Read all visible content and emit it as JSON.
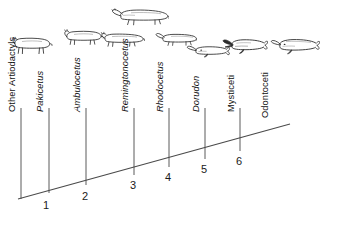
{
  "diagram": {
    "type": "cladogram",
    "line_color": "#4a4a4a",
    "text_color": "#111111"
  },
  "taxa": [
    {
      "id": "other-artiodactyls",
      "label": "Other Artiodactyls",
      "italic": false,
      "organism": "quadruped-mammal",
      "tip_x": 21,
      "label_x": 17,
      "label_y": 108,
      "branch_top_y": 108,
      "branch_bottom_y": 199
    },
    {
      "id": "pakicetus",
      "label": "Pakicetus",
      "italic": true,
      "organism": "quadruped-mammal",
      "tip_x": 49,
      "label_x": 45,
      "label_y": 108,
      "branch_top_y": 108,
      "branch_bottom_y": 193
    },
    {
      "id": "ambulocetus",
      "label": "Ambulocetus",
      "italic": true,
      "organism": "semiaquatic-mammal",
      "tip_x": 86,
      "label_x": 82,
      "label_y": 108,
      "branch_top_y": 108,
      "branch_bottom_y": 185
    },
    {
      "id": "remingtonocetus",
      "label": "Remingtonocetus",
      "italic": true,
      "organism": "long-snout-whale",
      "tip_x": 134,
      "label_x": 130,
      "label_y": 108,
      "branch_top_y": 108,
      "branch_bottom_y": 175
    },
    {
      "id": "rhodocetus",
      "label": "Rhodocetus",
      "italic": true,
      "organism": "early-whale",
      "tip_x": 169,
      "label_x": 165,
      "label_y": 108,
      "branch_top_y": 108,
      "branch_bottom_y": 167
    },
    {
      "id": "dorudon",
      "label": "Dorudon",
      "italic": true,
      "organism": "slender-whale",
      "tip_x": 205,
      "label_x": 201,
      "label_y": 108,
      "branch_top_y": 108,
      "branch_bottom_y": 159
    },
    {
      "id": "mysticeti",
      "label": "Mysticeti",
      "italic": false,
      "organism": "baleen-whale",
      "tip_x": 240,
      "label_x": 236,
      "label_y": 108,
      "branch_top_y": 108,
      "branch_bottom_y": 151
    },
    {
      "id": "odontoceti",
      "label": "Odontoceti",
      "italic": false,
      "organism": "toothed-whale",
      "tip_x": 290,
      "label_x": 270,
      "label_y": 108,
      "branch_top_y": 108,
      "branch_bottom_y": 124
    }
  ],
  "nodes": [
    {
      "id": "node-1",
      "label": "1",
      "x": 49,
      "y": 193,
      "text_x": 46,
      "text_y": 209
    },
    {
      "id": "node-2",
      "label": "2",
      "x": 86,
      "y": 185,
      "text_x": 85,
      "text_y": 200
    },
    {
      "id": "node-3",
      "label": "3",
      "x": 134,
      "y": 175,
      "text_x": 133,
      "text_y": 189
    },
    {
      "id": "node-4",
      "label": "4",
      "x": 169,
      "y": 167,
      "text_x": 168,
      "text_y": 181
    },
    {
      "id": "node-5",
      "label": "5",
      "x": 205,
      "y": 159,
      "text_x": 204,
      "text_y": 173
    },
    {
      "id": "node-6",
      "label": "6",
      "x": 240,
      "y": 151,
      "text_x": 239,
      "text_y": 165
    }
  ],
  "baseline": {
    "x1": 18,
    "y1": 199,
    "x2": 290,
    "y2": 124
  }
}
